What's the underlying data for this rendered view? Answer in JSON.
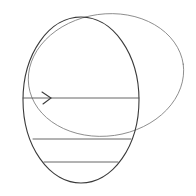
{
  "diagram": {
    "type": "pencil-sketch",
    "colors": {
      "background": "#ffffff",
      "stroke_dark": "#3a3a3a",
      "stroke_light": "#7a7a7a"
    },
    "shapes": {
      "front_ellipse": {
        "cx": 81,
        "cy": 100,
        "rx": 58,
        "ry": 83
      },
      "back_ellipse": {
        "cx": 106,
        "cy": 75,
        "rx": 78,
        "ry": 61,
        "rotation": -8
      },
      "lines": [
        {
          "x1": 23,
          "y1": 98,
          "x2": 139,
          "y2": 98,
          "arrow": true
        },
        {
          "x1": 33,
          "y1": 139,
          "x2": 131,
          "y2": 139
        },
        {
          "x1": 44,
          "y1": 162,
          "x2": 118,
          "y2": 162
        }
      ]
    }
  }
}
